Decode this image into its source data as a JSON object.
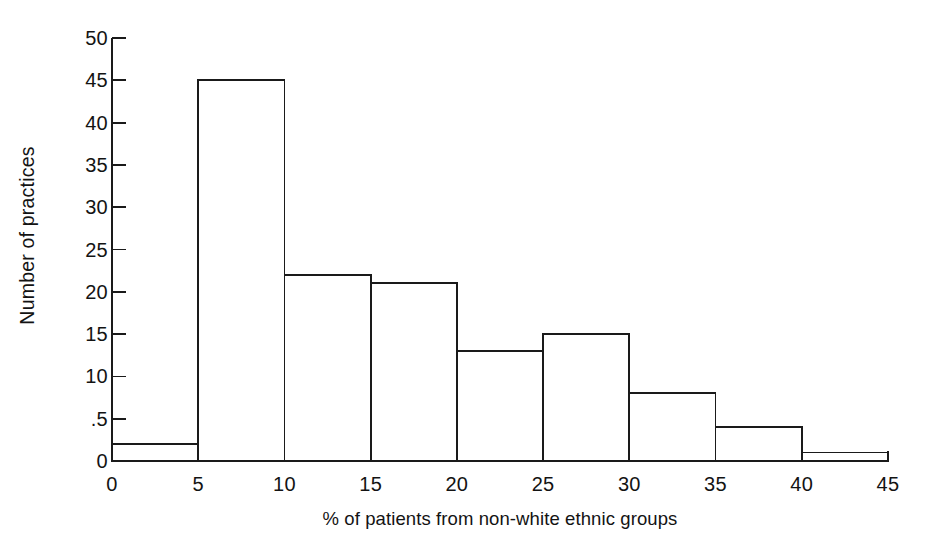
{
  "chart_data": {
    "type": "bar",
    "title": "",
    "subtitle": "",
    "xlabel": "% of patients from non-white ethnic groups",
    "ylabel": "Number of practices",
    "grid": false,
    "legend": null,
    "legend_position": "none",
    "bin_width": 5,
    "xlim": [
      0,
      45
    ],
    "ylim": [
      0,
      50
    ],
    "xticks": [
      "0",
      "5",
      "10",
      "15",
      "20",
      "25",
      "30",
      "35",
      "40",
      "45"
    ],
    "xtick_values": [
      0,
      5,
      10,
      15,
      20,
      25,
      30,
      35,
      40,
      45
    ],
    "yticks": [
      "0",
      ".5",
      "10",
      "15",
      "20",
      "25",
      "30",
      "35",
      "40",
      "45",
      "50"
    ],
    "ytick_values": [
      0,
      5,
      10,
      15,
      20,
      25,
      30,
      35,
      40,
      45,
      50
    ],
    "bin_edges": [
      0,
      5,
      10,
      15,
      20,
      25,
      30,
      35,
      40,
      45
    ],
    "categories": [
      "0-5",
      "5-10",
      "10-15",
      "15-20",
      "20-25",
      "25-30",
      "30-35",
      "35-40",
      "40-45"
    ],
    "values": [
      2,
      45,
      22,
      21,
      13,
      15,
      8,
      4,
      1
    ],
    "bar_fill": "#ffffff",
    "bar_stroke": "#1a1a1a",
    "axis_color": "#1a1a1a",
    "background": "#ffffff",
    "annotations": []
  }
}
